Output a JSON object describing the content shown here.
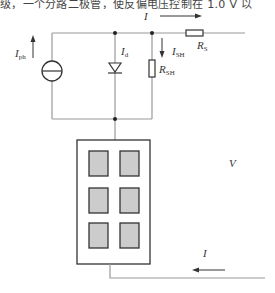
{
  "caption": {
    "text": "级，一个分路二极管，使反偏电压控制在 1.0 V 以"
  },
  "diagram": {
    "labels": {
      "I_top": {
        "main": "I",
        "sub": ""
      },
      "I_ph": {
        "main": "I",
        "sub": "ph"
      },
      "I_d": {
        "main": "I",
        "sub": "d"
      },
      "I_SH": {
        "main": "I",
        "sub": "SH"
      },
      "R_SH": {
        "main": "R",
        "sub": "SH"
      },
      "R_S": {
        "main": "R",
        "sub": "S"
      },
      "V": {
        "main": "V",
        "sub": ""
      },
      "I_bottom": {
        "main": "I",
        "sub": ""
      }
    },
    "components": [
      "current-source",
      "diode",
      "shunt-resistor",
      "series-resistor",
      "pv-panel"
    ],
    "panel": {
      "rows": 3,
      "cols": 2
    },
    "colors": {
      "wire": "#999999",
      "stroke": "#333333",
      "cell_fill": "#cccccc"
    }
  }
}
